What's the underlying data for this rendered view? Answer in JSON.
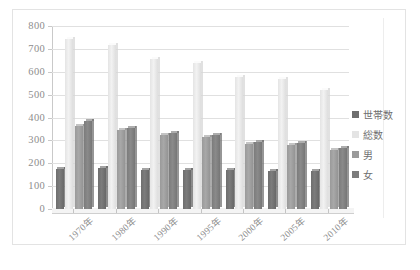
{
  "chart_data": {
    "type": "bar",
    "title": "",
    "xlabel": "",
    "ylabel": "",
    "ylim": [
      0,
      800
    ],
    "ytick_step": 100,
    "yticks": [
      "800",
      "700",
      "600",
      "500",
      "400",
      "300",
      "200",
      "100",
      "0"
    ],
    "grid": true,
    "legend_position": "right",
    "categories": [
      "1970年",
      "1980年",
      "1990年",
      "1995年",
      "2000年",
      "2005年",
      "2010年"
    ],
    "series": [
      {
        "name": "世帯数",
        "color": "#6e6e6e",
        "values": [
          175,
          180,
          172,
          172,
          170,
          168,
          168
        ]
      },
      {
        "name": "総数",
        "color": "#e4e4e4",
        "values": [
          745,
          715,
          655,
          640,
          575,
          570,
          520
        ]
      },
      {
        "name": "男",
        "color": "#9a9a9a",
        "values": [
          362,
          345,
          325,
          315,
          285,
          280,
          258
        ]
      },
      {
        "name": "女",
        "color": "#7c7c7c",
        "values": [
          385,
          355,
          333,
          322,
          293,
          288,
          265
        ]
      }
    ]
  },
  "caption": ""
}
